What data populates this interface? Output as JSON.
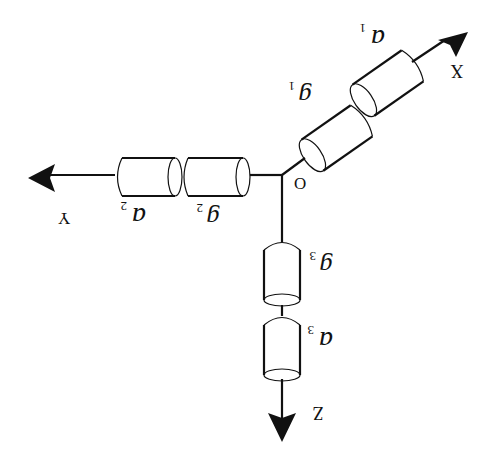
{
  "diagram": {
    "orientation": "rotated 180 degrees",
    "origin_label": "O",
    "axes": [
      {
        "name": "X",
        "element_g": "g",
        "element_g_sub": "1",
        "element_a": "a",
        "element_a_sub": "1"
      },
      {
        "name": "Y",
        "element_g": "g",
        "element_g_sub": "2",
        "element_a": "a",
        "element_a_sub": "2"
      },
      {
        "name": "Z",
        "element_g": "g",
        "element_g_sub": "3",
        "element_a": "a",
        "element_a_sub": "3"
      }
    ],
    "colors": {
      "stroke": "#111111",
      "background": "#ffffff"
    }
  }
}
